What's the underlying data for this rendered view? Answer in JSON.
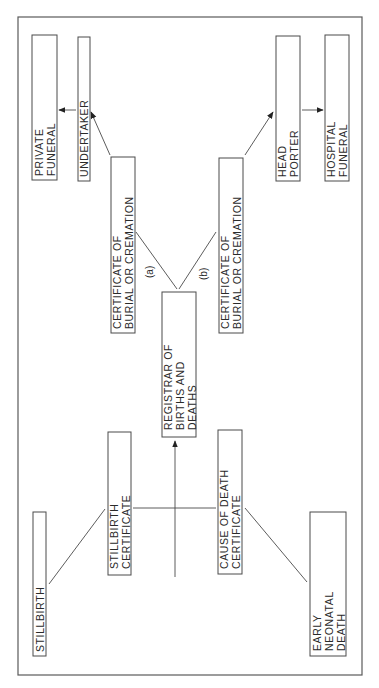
{
  "diagram": {
    "orientation": "rotated-90-ccw",
    "nodes": {
      "private_funeral": {
        "lines": [
          "PRIVATE",
          "FUNERAL"
        ]
      },
      "undertaker": {
        "lines": [
          "UNDERTAKER"
        ]
      },
      "cert_a": {
        "lines": [
          "CERTIFICATE OF",
          "BURIAL OR CREMATION"
        ]
      },
      "registrar": {
        "lines": [
          "REGISTRAR OF",
          "BIRTHS AND",
          "DEATHS"
        ]
      },
      "cert_b": {
        "lines": [
          "CERTIFICATE OF",
          "BURIAL OR CREMATION"
        ]
      },
      "head_porter": {
        "lines": [
          "HEAD",
          "PORTER"
        ]
      },
      "hospital_funeral": {
        "lines": [
          "HOSPITAL",
          "FUNERAL"
        ]
      },
      "stillbirth": {
        "lines": [
          "STILLBIRTH"
        ]
      },
      "stillbirth_cert": {
        "lines": [
          "STILLBIRTH",
          "CERTIFICATE"
        ]
      },
      "cause_of_death": {
        "lines": [
          "CAUSE OF DEATH",
          "CERTIFICATE"
        ]
      },
      "early_neonatal": {
        "lines": [
          "EARLY",
          "NEONATAL",
          "DEATH"
        ]
      }
    },
    "branch_labels": {
      "a": "(a)",
      "b": "(b)"
    },
    "edges": [
      {
        "from": "stillbirth",
        "to": "stillbirth_cert",
        "arrow": false
      },
      {
        "from": "early_neonatal",
        "to": "cause_of_death",
        "arrow": false
      },
      {
        "from": "stillbirth_cert",
        "to": "cause_of_death",
        "arrow": false
      },
      {
        "from": "junction",
        "to": "registrar",
        "arrow": true
      },
      {
        "from": "registrar",
        "to": "cert_a",
        "label": "(a)",
        "arrow": false
      },
      {
        "from": "registrar",
        "to": "cert_b",
        "label": "(b)",
        "arrow": false
      },
      {
        "from": "cert_a",
        "to": "undertaker",
        "arrow": true
      },
      {
        "from": "undertaker",
        "to": "private_funeral",
        "arrow": true
      },
      {
        "from": "cert_b",
        "to": "head_porter",
        "arrow": true
      },
      {
        "from": "head_porter",
        "to": "hospital_funeral",
        "arrow": true
      }
    ],
    "colors": {
      "stroke": "#4a4a4a",
      "text": "#2a2a2a",
      "background": "#ffffff"
    }
  }
}
